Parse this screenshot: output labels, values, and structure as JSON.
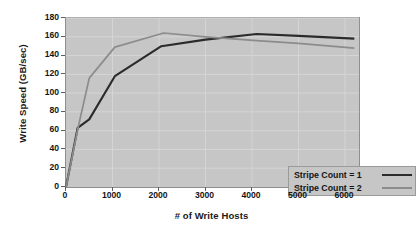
{
  "chart_data": {
    "type": "line",
    "title": "",
    "xlabel": "# of Write Hosts",
    "ylabel": "Write Speed (GB/sec)",
    "xlim": [
      0,
      6300
    ],
    "ylim": [
      0,
      180
    ],
    "xticks": [
      0,
      1000,
      2000,
      3000,
      4000,
      5000,
      6000
    ],
    "yticks": [
      0,
      20,
      40,
      60,
      80,
      100,
      120,
      140,
      160,
      180
    ],
    "xtick_labels": [
      "0",
      "1000",
      "2000",
      "3000",
      "4000",
      "5000",
      "6000"
    ],
    "ytick_labels": [
      "0",
      "20",
      "40",
      "60",
      "80",
      "100",
      "120",
      "140",
      "160",
      "180"
    ],
    "grid": true,
    "legend_position": "lower right",
    "plot_bgcolor": "#c6c6c6",
    "grid_color": "#d5d5d5",
    "series": [
      {
        "name": "Stripe Count = 1",
        "color": "#2b2b2b",
        "linewidth": 2.1,
        "x": [
          0,
          250,
          500,
          1050,
          2050,
          3000,
          4100,
          5000,
          6200
        ],
        "y": [
          0,
          63,
          72,
          118,
          150,
          157,
          163,
          161,
          158
        ]
      },
      {
        "name": "Stripe Count = 2",
        "color": "#8c8c8c",
        "linewidth": 1.7,
        "x": [
          0,
          250,
          500,
          1050,
          2100,
          3000,
          4100,
          5000,
          6200
        ],
        "y": [
          0,
          61,
          116,
          149,
          164,
          160,
          156,
          153,
          148
        ]
      }
    ]
  },
  "legend": {
    "entries": [
      {
        "label": "Stripe Count = 1",
        "color": "#2b2b2b"
      },
      {
        "label": "Stripe Count = 2",
        "color": "#8c8c8c"
      }
    ]
  }
}
